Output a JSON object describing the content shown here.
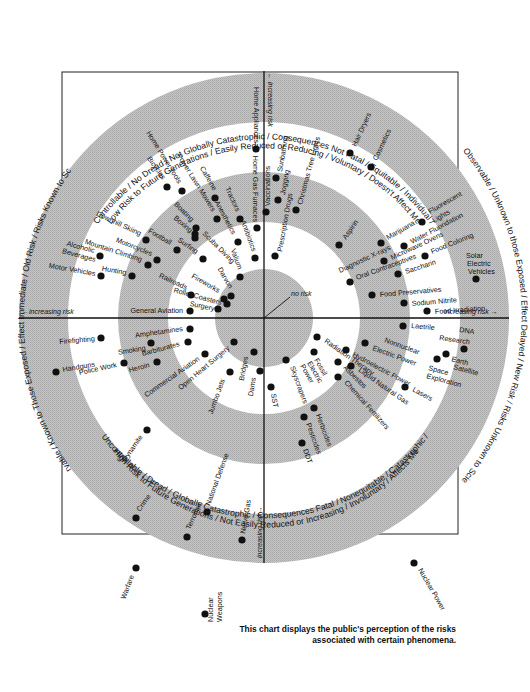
{
  "diagram": {
    "center": [
      264,
      318
    ],
    "rings": [
      245,
      196,
      146,
      96,
      49
    ],
    "ring_colors": [
      "#bdbdbd",
      "#ffffff",
      "#bdbdbd",
      "#ffffff",
      "#bdbdbd"
    ],
    "dot_color": "#111111",
    "frame": {
      "x": 62,
      "y": 72,
      "w": 396,
      "h": 462
    },
    "caption_line1": "This chart displays the public's perception of the risks",
    "caption_line2": "associated with certain phenomena.",
    "center_label": "no risk",
    "axis_labels": {
      "top": "← increasing risk",
      "left": "←increasing risk",
      "right": "increasing risk →",
      "bottom": "increasing risk→"
    },
    "quadrant_labels": {
      "top_line1": "Controllable / No Dread / Not Globally Catastrophic / Consequences Not Fatal / Equitable / Individual /",
      "top_line2": "Low Risk to Future Generations / Easily Reduced or Reducing / Voluntary / Doesn't Affect Me",
      "bottom_line1": "Uncontrollable / Dread / Globally Catastrophic / Consequences Fatal / Nonequitable / Catastrophic /",
      "bottom_line2": "High Risk to Future Generations / Not Easily Reduced or Increasing / Involuntary / Affects Me",
      "left": "Observable / Known to Those Exposed / Effect Immediate / Old Risk / Risks Known to Science",
      "right": "Not Observable / Unknown to those Exposed / Effect Delayed / New Risk / Risks Unknown to Science"
    },
    "hazards": [
      {
        "label": "Home Appliances",
        "x": 256,
        "y": 149,
        "lx": 254,
        "ly": 143,
        "rot": 90,
        "anchor": "end"
      },
      {
        "label": "Home Gas Furnaces",
        "x": 257,
        "y": 228,
        "lx": 253,
        "ly": 222,
        "rot": 90,
        "anchor": "end"
      },
      {
        "label": "Vaccinations",
        "x": 266,
        "y": 212,
        "lx": 270,
        "ly": 206,
        "rot": -90,
        "anchor": "start"
      },
      {
        "label": "Sunbathing",
        "x": 276,
        "y": 178,
        "lx": 282,
        "ly": 172,
        "rot": -80,
        "anchor": "start"
      },
      {
        "label": "Jogging",
        "x": 278,
        "y": 200,
        "lx": 285,
        "ly": 195,
        "rot": -80,
        "anchor": "start"
      },
      {
        "label": "Prescription Drugs",
        "x": 275,
        "y": 256,
        "lx": 282,
        "ly": 252,
        "rot": -80,
        "anchor": "start"
      },
      {
        "label": "Christmas Tree Lights",
        "x": 296,
        "y": 210,
        "lx": 302,
        "ly": 205,
        "rot": -75,
        "anchor": "start"
      },
      {
        "label": "Hair Dryers",
        "x": 350,
        "y": 153,
        "lx": 356,
        "ly": 147,
        "rot": -65,
        "anchor": "start"
      },
      {
        "label": "Cosmetics",
        "x": 371,
        "y": 167,
        "lx": 377,
        "ly": 161,
        "rot": -65,
        "anchor": "start"
      },
      {
        "label": "Aspirin",
        "x": 339,
        "y": 245,
        "lx": 346,
        "ly": 240,
        "rot": -55,
        "anchor": "start"
      },
      {
        "label": "Marijuana",
        "x": 381,
        "y": 243,
        "lx": 388,
        "ly": 240,
        "rot": -30,
        "anchor": "start"
      },
      {
        "label": "Fluorescent",
        "x": 422,
        "y": 222,
        "lx": 430,
        "ly": 214,
        "rot": -30,
        "anchor": "start"
      },
      {
        "label": "Lights",
        "x": 0,
        "y": 0,
        "lx": 434,
        "ly": 223,
        "rot": -30,
        "anchor": "start",
        "nodot": true
      },
      {
        "label": "Water Fluoridation",
        "x": 404,
        "y": 246,
        "lx": 412,
        "ly": 244,
        "rot": -28,
        "anchor": "start"
      },
      {
        "label": "Microwave Ovens",
        "x": 384,
        "y": 261,
        "lx": 392,
        "ly": 260,
        "rot": -25,
        "anchor": "start"
      },
      {
        "label": "Diagnostic X-rays",
        "x": 0,
        "y": 0,
        "lx": 340,
        "ly": 273,
        "rot": -25,
        "anchor": "start",
        "nodot": true
      },
      {
        "label": "Food Coloring",
        "x": 425,
        "y": 256,
        "lx": 432,
        "ly": 254,
        "rot": -22,
        "anchor": "start"
      },
      {
        "label": "Oral Contraceptives",
        "x": 350,
        "y": 282,
        "lx": 357,
        "ly": 280,
        "rot": -20,
        "anchor": "start"
      },
      {
        "label": "Saccharin",
        "x": 398,
        "y": 274,
        "lx": 406,
        "ly": 274,
        "rot": -18,
        "anchor": "start"
      },
      {
        "label": "Solar",
        "x": 476,
        "y": 279,
        "lx": 466,
        "ly": 258,
        "rot": 0,
        "anchor": "start"
      },
      {
        "label": "Electric",
        "x": 0,
        "y": 0,
        "lx": 467,
        "ly": 266,
        "rot": 0,
        "anchor": "start",
        "nodot": true
      },
      {
        "label": "Vehicles",
        "x": 0,
        "y": 0,
        "lx": 468,
        "ly": 274,
        "rot": 0,
        "anchor": "start",
        "nodot": true
      },
      {
        "label": "Food Preservatives",
        "x": 372,
        "y": 295,
        "lx": 380,
        "ly": 297,
        "rot": -5,
        "anchor": "start"
      },
      {
        "label": "Sodium Nitrite",
        "x": 404,
        "y": 303,
        "lx": 412,
        "ly": 306,
        "rot": -5,
        "anchor": "start"
      },
      {
        "label": "Food Irradiation",
        "x": 427,
        "y": 311,
        "lx": 435,
        "ly": 314,
        "rot": -4,
        "anchor": "start"
      },
      {
        "label": "Laetrile",
        "x": 403,
        "y": 326,
        "lx": 411,
        "ly": 328,
        "rot": 5,
        "anchor": "start"
      },
      {
        "label": "DNA",
        "x": 0,
        "y": 0,
        "lx": 459,
        "ly": 332,
        "rot": 8,
        "anchor": "start",
        "nodot": true
      },
      {
        "label": "Research",
        "x": 464,
        "y": 349,
        "lx": 439,
        "ly": 340,
        "rot": 8,
        "anchor": "start"
      },
      {
        "label": "Earth",
        "x": 446,
        "y": 354,
        "lx": 451,
        "ly": 361,
        "rot": 15,
        "anchor": "start"
      },
      {
        "label": "Satellite",
        "x": 0,
        "y": 0,
        "lx": 453,
        "ly": 369,
        "rot": 15,
        "anchor": "start",
        "nodot": true
      },
      {
        "label": "Space",
        "x": 437,
        "y": 359,
        "lx": 428,
        "ly": 370,
        "rot": 15,
        "anchor": "start"
      },
      {
        "label": "Exploration",
        "x": 0,
        "y": 0,
        "lx": 426,
        "ly": 378,
        "rot": 15,
        "anchor": "start",
        "nodot": true
      },
      {
        "label": "Nonnuclear",
        "x": 0,
        "y": 0,
        "lx": 384,
        "ly": 342,
        "rot": 20,
        "anchor": "start",
        "nodot": true
      },
      {
        "label": "Electric Power",
        "x": 365,
        "y": 343,
        "lx": 372,
        "ly": 350,
        "rot": 20,
        "anchor": "start"
      },
      {
        "label": "Radiation Therapy",
        "x": 317,
        "y": 337,
        "lx": 324,
        "ly": 342,
        "rot": 35,
        "anchor": "start"
      },
      {
        "label": "Hydroelectric Power",
        "x": 346,
        "y": 350,
        "lx": 352,
        "ly": 356,
        "rot": 28,
        "anchor": "start"
      },
      {
        "label": "Lasers",
        "x": 405,
        "y": 387,
        "lx": 412,
        "ly": 391,
        "rot": 28,
        "anchor": "start"
      },
      {
        "label": "Liquid Natural Gas",
        "x": 351,
        "y": 366,
        "lx": 358,
        "ly": 371,
        "rot": 35,
        "anchor": "start"
      },
      {
        "label": "Asbestos",
        "x": 338,
        "y": 362,
        "lx": 343,
        "ly": 368,
        "rot": 45,
        "anchor": "start"
      },
      {
        "label": "Chemical Fertilizers",
        "x": 338,
        "y": 377,
        "lx": 344,
        "ly": 383,
        "rot": 48,
        "anchor": "start"
      },
      {
        "label": "Fossil",
        "x": 314,
        "y": 352,
        "lx": 314,
        "ly": 360,
        "rot": 60,
        "anchor": "start"
      },
      {
        "label": "Electric",
        "x": 0,
        "y": 0,
        "lx": 307,
        "ly": 363,
        "rot": 60,
        "anchor": "start",
        "nodot": true
      },
      {
        "label": "Power",
        "x": 0,
        "y": 0,
        "lx": 300,
        "ly": 366,
        "rot": 60,
        "anchor": "start",
        "nodot": true
      },
      {
        "label": "Skyscrapers",
        "x": 286,
        "y": 360,
        "lx": 290,
        "ly": 367,
        "rot": 70,
        "anchor": "start"
      },
      {
        "label": "SST",
        "x": 271,
        "y": 387,
        "lx": 271,
        "ly": 394,
        "rot": 80,
        "anchor": "start"
      },
      {
        "label": "Herbicides",
        "x": 314,
        "y": 408,
        "lx": 316,
        "ly": 415,
        "rot": 70,
        "anchor": "start"
      },
      {
        "label": "Pesticides",
        "x": 304,
        "y": 417,
        "lx": 306,
        "ly": 424,
        "rot": 70,
        "anchor": "start"
      },
      {
        "label": "DDT",
        "x": 302,
        "y": 443,
        "lx": 303,
        "ly": 450,
        "rot": 70,
        "anchor": "start"
      },
      {
        "label": "Dams",
        "x": 260,
        "y": 371,
        "lx": 256,
        "ly": 378,
        "rot": -80,
        "anchor": "end"
      },
      {
        "label": "Bridges",
        "x": 254,
        "y": 352,
        "lx": 248,
        "ly": 357,
        "rot": -80,
        "anchor": "end"
      },
      {
        "label": "Jumbo Jets",
        "x": 230,
        "y": 372,
        "lx": 225,
        "ly": 380,
        "rot": -70,
        "anchor": "end"
      },
      {
        "label": "Open Heart Surgery",
        "x": 234,
        "y": 342,
        "lx": 230,
        "ly": 349,
        "rot": -40,
        "anchor": "end"
      },
      {
        "label": "Commercial Aviation",
        "x": 205,
        "y": 354,
        "lx": 200,
        "ly": 360,
        "rot": -35,
        "anchor": "end"
      },
      {
        "label": "Amphetamines",
        "x": 190,
        "y": 329,
        "lx": 183,
        "ly": 331,
        "rot": -8,
        "anchor": "end"
      },
      {
        "label": "Barbiturates",
        "x": 188,
        "y": 342,
        "lx": 180,
        "ly": 346,
        "rot": -15,
        "anchor": "end"
      },
      {
        "label": "Smoking",
        "x": 151,
        "y": 343,
        "lx": 146,
        "ly": 350,
        "rot": -10,
        "anchor": "end"
      },
      {
        "label": "Heroin",
        "x": 157,
        "y": 362,
        "lx": 150,
        "ly": 367,
        "rot": -15,
        "anchor": "end"
      },
      {
        "label": "Firefighting",
        "x": 101,
        "y": 338,
        "lx": 95,
        "ly": 341,
        "rot": -5,
        "anchor": "end"
      },
      {
        "label": "Handguns",
        "x": 56,
        "y": 372,
        "lx": 63,
        "ly": 372,
        "rot": -10,
        "anchor": "start"
      },
      {
        "label": "Police Work",
        "x": 124,
        "y": 363,
        "lx": 117,
        "ly": 367,
        "rot": -12,
        "anchor": "end"
      },
      {
        "label": "Dynamite",
        "x": 147,
        "y": 430,
        "lx": 143,
        "ly": 437,
        "rot": -55,
        "anchor": "end"
      },
      {
        "label": "Crime",
        "x": 136,
        "y": 518,
        "lx": 140,
        "ly": 512,
        "rot": -55,
        "anchor": "start"
      },
      {
        "label": "Terrorism",
        "x": 187,
        "y": 537,
        "lx": 190,
        "ly": 530,
        "rot": -65,
        "anchor": "start"
      },
      {
        "label": "National Defense",
        "x": 207,
        "y": 512,
        "lx": 210,
        "ly": 506,
        "rot": -70,
        "anchor": "start"
      },
      {
        "label": "Nerve Gas",
        "x": 242,
        "y": 540,
        "lx": 245,
        "ly": 534,
        "rot": -80,
        "anchor": "start"
      },
      {
        "label": "Warfare",
        "x": 136,
        "y": 568,
        "lx": 134,
        "ly": 576,
        "rot": -70,
        "anchor": "end"
      },
      {
        "label": "Nuclear",
        "x": 205,
        "y": 614,
        "lx": 213,
        "ly": 622,
        "rot": -90,
        "anchor": "start"
      },
      {
        "label": "Weapons",
        "x": 0,
        "y": 0,
        "lx": 222,
        "ly": 622,
        "rot": -90,
        "anchor": "start",
        "nodot": true
      },
      {
        "label": "Nuclear Power",
        "x": 414,
        "y": 563,
        "lx": 418,
        "ly": 570,
        "rot": 60,
        "anchor": "start"
      },
      {
        "label": "Valium",
        "x": 240,
        "y": 277,
        "lx": 238,
        "ly": 270,
        "rot": 70,
        "anchor": "end"
      },
      {
        "label": "Darvon",
        "x": 231,
        "y": 296,
        "lx": 229,
        "ly": 289,
        "rot": 60,
        "anchor": "end"
      },
      {
        "label": "Fireworks",
        "x": 224,
        "y": 299,
        "lx": 218,
        "ly": 293,
        "rot": 30,
        "anchor": "end"
      },
      {
        "label": "Roller Coasters",
        "x": 227,
        "y": 304,
        "lx": 221,
        "ly": 305,
        "rot": 15,
        "anchor": "end"
      },
      {
        "label": "Surgery",
        "x": 218,
        "y": 309,
        "lx": 214,
        "ly": 311,
        "rot": 12,
        "anchor": "end"
      },
      {
        "label": "General Aviation",
        "x": 190,
        "y": 311,
        "lx": 183,
        "ly": 313,
        "rot": 0,
        "anchor": "end"
      },
      {
        "label": "Railroads",
        "x": 191,
        "y": 295,
        "lx": 186,
        "ly": 290,
        "rot": 25,
        "anchor": "end"
      },
      {
        "label": "Antibiotics",
        "x": 255,
        "y": 258,
        "lx": 252,
        "ly": 252,
        "rot": 70,
        "anchor": "end"
      },
      {
        "label": "Tractors",
        "x": 240,
        "y": 219,
        "lx": 236,
        "ly": 212,
        "rot": 65,
        "anchor": "end"
      },
      {
        "label": "Anesthetics",
        "x": 238,
        "y": 242,
        "lx": 232,
        "ly": 235,
        "rot": 62,
        "anchor": "end"
      },
      {
        "label": "Caffeine",
        "x": 215,
        "y": 198,
        "lx": 213,
        "ly": 191,
        "rot": 60,
        "anchor": "end"
      },
      {
        "label": "Power Lawn Mowers",
        "x": 217,
        "y": 219,
        "lx": 212,
        "ly": 212,
        "rot": 58,
        "anchor": "end"
      },
      {
        "label": "Home Power Tools",
        "x": 182,
        "y": 191,
        "lx": 178,
        "ly": 184,
        "rot": 58,
        "anchor": "end"
      },
      {
        "label": "Bicycles",
        "x": 167,
        "y": 187,
        "lx": 162,
        "ly": 180,
        "rot": 55,
        "anchor": "end"
      },
      {
        "label": "Boating",
        "x": 196,
        "y": 228,
        "lx": 191,
        "ly": 222,
        "rot": 45,
        "anchor": "end"
      },
      {
        "label": "Scuba Diving",
        "x": 195,
        "y": 234,
        "lx": 202,
        "ly": 234,
        "rot": 45,
        "anchor": "start"
      },
      {
        "label": "Boxing",
        "x": 195,
        "y": 238,
        "lx": 190,
        "ly": 233,
        "rot": 40,
        "anchor": "end"
      },
      {
        "label": "Surfing",
        "x": 203,
        "y": 259,
        "lx": 196,
        "ly": 254,
        "rot": 35,
        "anchor": "end"
      },
      {
        "label": "Football",
        "x": 177,
        "y": 250,
        "lx": 170,
        "ly": 245,
        "rot": 30,
        "anchor": "end"
      },
      {
        "label": "Downhill Skiing",
        "x": 146,
        "y": 240,
        "lx": 140,
        "ly": 236,
        "rot": 25,
        "anchor": "end"
      },
      {
        "label": "Motorcycles",
        "x": 157,
        "y": 260,
        "lx": 151,
        "ly": 256,
        "rot": 22,
        "anchor": "end"
      },
      {
        "label": "Mountain Climbing",
        "x": 148,
        "y": 265,
        "lx": 141,
        "ly": 262,
        "rot": 18,
        "anchor": "end"
      },
      {
        "label": "Alcoholic",
        "x": 100,
        "y": 256,
        "lx": 94,
        "ly": 253,
        "rot": 15,
        "anchor": "end"
      },
      {
        "label": "Beverages",
        "x": 0,
        "y": 0,
        "lx": 95,
        "ly": 262,
        "rot": 15,
        "anchor": "end",
        "nodot": true
      },
      {
        "label": "Motor Vehicles",
        "x": 101,
        "y": 276,
        "lx": 95,
        "ly": 276,
        "rot": 10,
        "anchor": "end"
      },
      {
        "label": "Hunting",
        "x": 132,
        "y": 276,
        "lx": 126,
        "ly": 275,
        "rot": 10,
        "anchor": "end"
      }
    ]
  }
}
